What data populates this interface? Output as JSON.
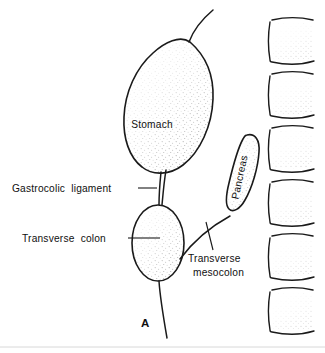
{
  "figure": {
    "panel_letter": "A",
    "background_color": "#ffffff",
    "ink_color": "#1a1a1a",
    "stipple_color": "#9a9a9a",
    "width": 325,
    "height": 353
  },
  "organs": [
    {
      "id": "stomach",
      "label": "Stomach",
      "label_x": 152,
      "label_y": 128,
      "rotation": 0,
      "shape": "teardrop"
    },
    {
      "id": "pancreas",
      "label": "Pancreas",
      "label_x": 243,
      "label_y": 178,
      "rotation": -78,
      "shape": "elongated-oval"
    },
    {
      "id": "transverse-colon",
      "label": "",
      "shape": "vertical-oval"
    }
  ],
  "callouts": [
    {
      "id": "gastrocolic-ligament",
      "lines": [
        "Gastrocolic  ligament"
      ],
      "text_x": 12,
      "text_y": 192,
      "leader": {
        "x1": 138,
        "y1": 188,
        "x2": 157,
        "y2": 188
      }
    },
    {
      "id": "transverse-colon",
      "lines": [
        "Transverse  colon"
      ],
      "text_x": 22,
      "text_y": 242,
      "leader": {
        "x1": 128,
        "y1": 238,
        "x2": 160,
        "y2": 238
      }
    },
    {
      "id": "transverse-mesocolon",
      "lines": [
        "Transverse",
        "mesocolon"
      ],
      "text_x": 188,
      "text_y": 262,
      "line_height": 14,
      "leader": {
        "x1": 206,
        "y1": 222,
        "x2": 213,
        "y2": 250
      }
    }
  ],
  "vertebrae": {
    "count": 6,
    "name": "lumbar-vertebral-bodies",
    "x": 266,
    "top": 16,
    "body_width": 50,
    "body_height": 43,
    "pitch": 54
  },
  "connections": [
    {
      "id": "esophagus-greater-omentum",
      "from": "stomach-apex",
      "to": "upper-right"
    },
    {
      "id": "gastrocolic-ligament-band",
      "from": "stomach-base",
      "to": "colon-top"
    },
    {
      "id": "transverse-mesocolon-band",
      "from": "colon-right",
      "to": "pancreas-base"
    },
    {
      "id": "greater-omentum-descending",
      "from": "colon-base",
      "to": "lower-right"
    }
  ]
}
